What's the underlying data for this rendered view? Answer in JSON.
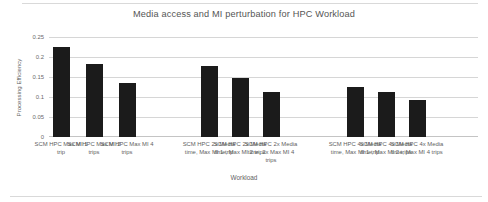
{
  "chart_data": {
    "type": "bar",
    "title": "Media access and MI perturbation for HPC Workload",
    "xlabel": "Workload",
    "ylabel": "Processing Efficiency",
    "ylim": [
      0,
      0.25
    ],
    "grid": true,
    "legend": null,
    "ytick_labels": [
      "0.25",
      "0.2",
      "0.15",
      "0.1",
      "0.05",
      "0"
    ],
    "ytick_values": [
      0.25,
      0.2,
      0.15,
      0.1,
      0.05,
      0
    ],
    "bar_color": "#1b1b1b",
    "categories": [
      "SCM HPC Max MI 1 trip",
      "SCM HPC Max MI 2 trips",
      "SCM HPC Max MI 4 trips",
      "SCM HPC 2x Media time, Max MI 1 trip",
      "SCM HPC 2x Media time, Max MI 2 trips",
      "SCM HPC 2x Media time, 2x Max MI 4 trips",
      "SCM HPC 4x Media time, Max MI 1 trip",
      "SCM HPC 4x Media time, Max MI 2 trips",
      "SCM HPC 4x Media time, Max MI 4 trips"
    ],
    "values": [
      0.225,
      0.183,
      0.135,
      0.178,
      0.148,
      0.113,
      0.125,
      0.113,
      0.093
    ]
  }
}
